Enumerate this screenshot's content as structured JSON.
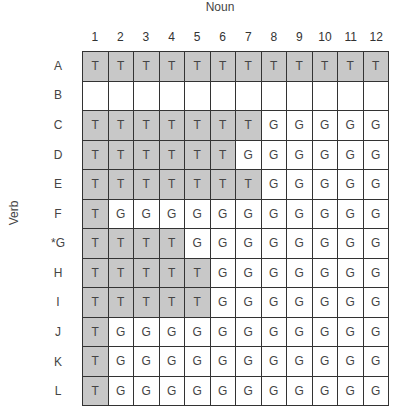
{
  "titles": {
    "x_axis": "Noun",
    "y_axis": "Verb"
  },
  "columns": [
    "1",
    "2",
    "3",
    "4",
    "5",
    "6",
    "7",
    "8",
    "9",
    "10",
    "11",
    "12"
  ],
  "rows": [
    {
      "label": "A",
      "cells": [
        "T",
        "T",
        "T",
        "T",
        "T",
        "T",
        "T",
        "T",
        "T",
        "T",
        "T",
        "T"
      ]
    },
    {
      "label": "B",
      "cells": [
        "",
        "",
        "",
        "",
        "",
        "",
        "",
        "",
        "",
        "",
        "",
        ""
      ]
    },
    {
      "label": "C",
      "cells": [
        "T",
        "T",
        "T",
        "T",
        "T",
        "T",
        "T",
        "G",
        "G",
        "G",
        "G",
        "G"
      ]
    },
    {
      "label": "D",
      "cells": [
        "T",
        "T",
        "T",
        "T",
        "T",
        "T",
        "G",
        "G",
        "G",
        "G",
        "G",
        "G"
      ]
    },
    {
      "label": "E",
      "cells": [
        "T",
        "T",
        "T",
        "T",
        "T",
        "T",
        "T",
        "G",
        "G",
        "G",
        "G",
        "G"
      ]
    },
    {
      "label": "F",
      "cells": [
        "T",
        "G",
        "G",
        "G",
        "G",
        "G",
        "G",
        "G",
        "G",
        "G",
        "G",
        "G"
      ]
    },
    {
      "label": "*G",
      "cells": [
        "T",
        "T",
        "T",
        "T",
        "G",
        "G",
        "G",
        "G",
        "G",
        "G",
        "G",
        "G"
      ]
    },
    {
      "label": "H",
      "cells": [
        "T",
        "T",
        "T",
        "T",
        "T",
        "G",
        "G",
        "G",
        "G",
        "G",
        "G",
        "G"
      ]
    },
    {
      "label": "I",
      "cells": [
        "T",
        "T",
        "T",
        "T",
        "T",
        "G",
        "G",
        "G",
        "G",
        "G",
        "G",
        "G"
      ]
    },
    {
      "label": "J",
      "cells": [
        "T",
        "G",
        "G",
        "G",
        "G",
        "G",
        "G",
        "G",
        "G",
        "G",
        "G",
        "G"
      ]
    },
    {
      "label": "K",
      "cells": [
        "T",
        "G",
        "G",
        "G",
        "G",
        "G",
        "G",
        "G",
        "G",
        "G",
        "G",
        "G"
      ]
    },
    {
      "label": "L",
      "cells": [
        "T",
        "G",
        "G",
        "G",
        "G",
        "G",
        "G",
        "G",
        "G",
        "G",
        "G",
        "G"
      ]
    }
  ],
  "legend": {
    "T": "shaded",
    "G": "unshaded"
  },
  "colors": {
    "shaded": "#c8c8c8",
    "unshaded": "#ffffff",
    "grid_line": "#333333"
  }
}
